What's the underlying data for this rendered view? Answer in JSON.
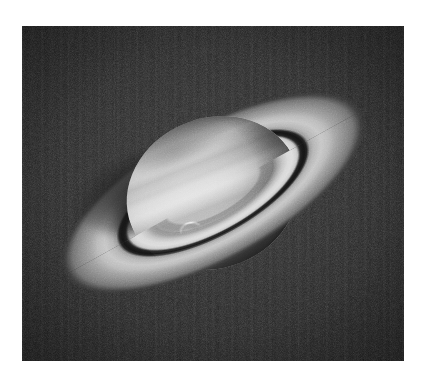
{
  "page": {
    "background_color": "#ffffff",
    "media_type": "photograph",
    "color_mode": "grayscale"
  },
  "photo": {
    "subject": "Saturn",
    "description": "Black-and-white telescopic photograph of the planet Saturn with its ring system tilted toward the viewer",
    "background_color": "#1b1b1b",
    "frame": {
      "left": 22,
      "top": 26,
      "width": 382,
      "height": 335
    },
    "features": [
      {
        "name": "globe",
        "label": "Saturn globe",
        "detail": "Oblate disk with horizontal cloud belts and zones"
      },
      {
        "name": "polar-hood",
        "label": "North polar region",
        "detail": "Darker grey polar cap at upper edge of globe"
      },
      {
        "name": "storm-spot",
        "label": "Bright storm spot",
        "detail": "Small bright crescent feature on the lower-left of the globe"
      },
      {
        "name": "ring-a",
        "label": "A ring",
        "detail": "Outer ring, moderately bright"
      },
      {
        "name": "cassini-division",
        "label": "Cassini Division",
        "detail": "Dark gap separating the A ring from the B ring"
      },
      {
        "name": "ring-b",
        "label": "B ring",
        "detail": "Brightest inner ring"
      },
      {
        "name": "ring-c",
        "label": "C ring",
        "detail": "Faint innermost ring, low contrast"
      },
      {
        "name": "ring-shadow",
        "label": "Planet shadow on rings",
        "detail": "Dark wedge where the globe shadows the far side of the rings"
      }
    ],
    "ring_tilt_degrees": -29,
    "grain": "visible film grain with faint vertical scan banding"
  }
}
